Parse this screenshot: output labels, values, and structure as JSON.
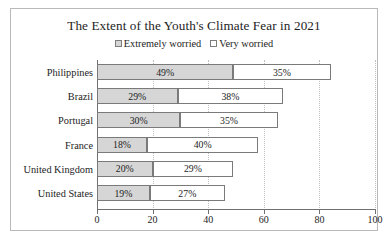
{
  "chart_data": {
    "type": "bar",
    "orientation": "horizontal",
    "stacked": true,
    "title": "The Extent of the Youth's Climate Fear in 2021",
    "xlabel": "",
    "ylabel": "",
    "xlim": [
      0,
      100
    ],
    "xticks": [
      0,
      20,
      40,
      60,
      80,
      100
    ],
    "xticklabels": [
      "0",
      "20",
      "40",
      "60",
      "80",
      "100"
    ],
    "grid": true,
    "grid_axis": "x",
    "legend_position": "top-center",
    "categories": [
      "Philippines",
      "Brazil",
      "Portugal",
      "France",
      "United Kingdom",
      "United States"
    ],
    "series": [
      {
        "name": "Extremely worried",
        "color": "#d6d6d6",
        "values": [
          49,
          29,
          30,
          18,
          20,
          19
        ],
        "labels": [
          "49%",
          "29%",
          "30%",
          "18%",
          "20%",
          "19%"
        ]
      },
      {
        "name": "Very worried",
        "color": "#ffffff",
        "values": [
          35,
          38,
          35,
          40,
          29,
          27
        ],
        "labels": [
          "35%",
          "38%",
          "35%",
          "40%",
          "29%",
          "27%"
        ]
      }
    ]
  }
}
